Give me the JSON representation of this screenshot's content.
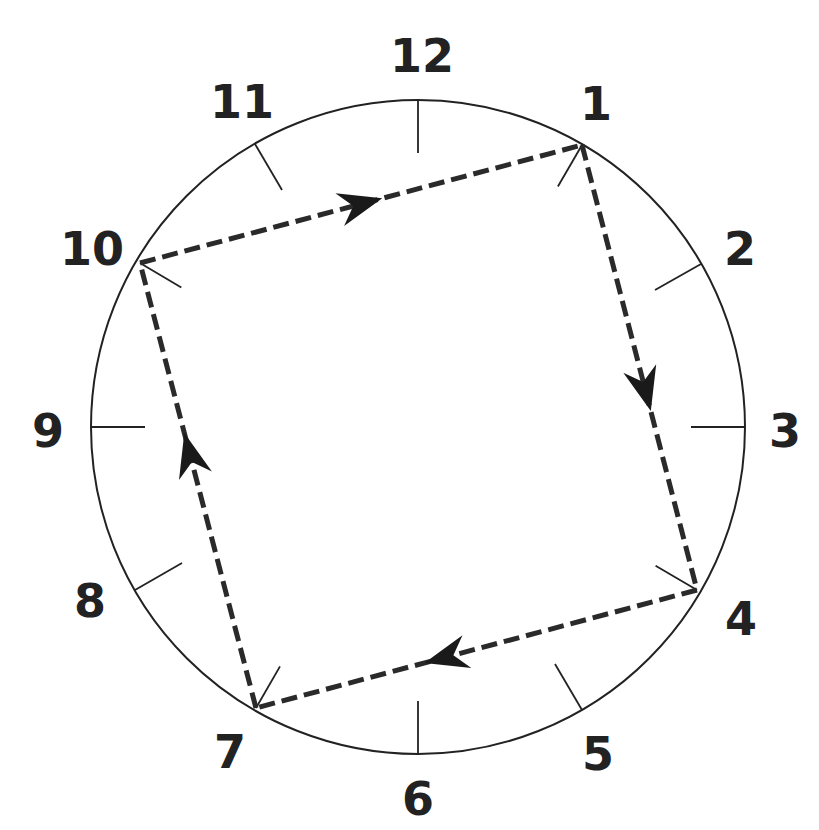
{
  "diagram": {
    "title": "",
    "type": "clock-face-cycle",
    "center": [
      418,
      427
    ],
    "radius": 327,
    "numerals": [
      {
        "label": "12",
        "x": 422,
        "y": 72
      },
      {
        "label": "1",
        "x": 596,
        "y": 120
      },
      {
        "label": "2",
        "x": 740,
        "y": 265
      },
      {
        "label": "3",
        "x": 785,
        "y": 447
      },
      {
        "label": "4",
        "x": 741,
        "y": 635
      },
      {
        "label": "5",
        "x": 598,
        "y": 770
      },
      {
        "label": "6",
        "x": 418,
        "y": 815
      },
      {
        "label": "7",
        "x": 230,
        "y": 768
      },
      {
        "label": "8",
        "x": 90,
        "y": 617
      },
      {
        "label": "9",
        "x": 48,
        "y": 447
      },
      {
        "label": "10",
        "x": 92,
        "y": 265
      },
      {
        "label": "11",
        "x": 242,
        "y": 118
      }
    ],
    "ticks": [
      {
        "hour": 12,
        "x1": 418,
        "y1": 100,
        "x2": 418,
        "y2": 153
      },
      {
        "hour": 2,
        "x1": 701,
        "y1": 264,
        "x2": 655,
        "y2": 290
      },
      {
        "hour": 3,
        "x1": 745,
        "y1": 427,
        "x2": 691,
        "y2": 427
      },
      {
        "hour": 5,
        "x1": 582,
        "y1": 710,
        "x2": 555,
        "y2": 664
      },
      {
        "hour": 6,
        "x1": 418,
        "y1": 754,
        "x2": 418,
        "y2": 701
      },
      {
        "hour": 8,
        "x1": 135,
        "y1": 590,
        "x2": 182,
        "y2": 563
      },
      {
        "hour": 9,
        "x1": 91,
        "y1": 427,
        "x2": 145,
        "y2": 427
      },
      {
        "hour": 11,
        "x1": 255,
        "y1": 144,
        "x2": 282,
        "y2": 190
      }
    ],
    "cycle": {
      "vertices": [
        {
          "hour": 10,
          "x": 140,
          "y": 263
        },
        {
          "hour": 1,
          "x": 582,
          "y": 145
        },
        {
          "hour": 4,
          "x": 697,
          "y": 590
        },
        {
          "hour": 7,
          "x": 256,
          "y": 708
        }
      ],
      "edges": [
        {
          "from": 10,
          "to": 1,
          "arrow_at": 0.5
        },
        {
          "from": 1,
          "to": 4,
          "arrow_at": 0.55
        },
        {
          "from": 4,
          "to": 7,
          "arrow_at": 0.57
        },
        {
          "from": 7,
          "to": 10,
          "arrow_at": 0.57
        }
      ],
      "style": "dashed",
      "color": "#2a2a2a"
    }
  }
}
